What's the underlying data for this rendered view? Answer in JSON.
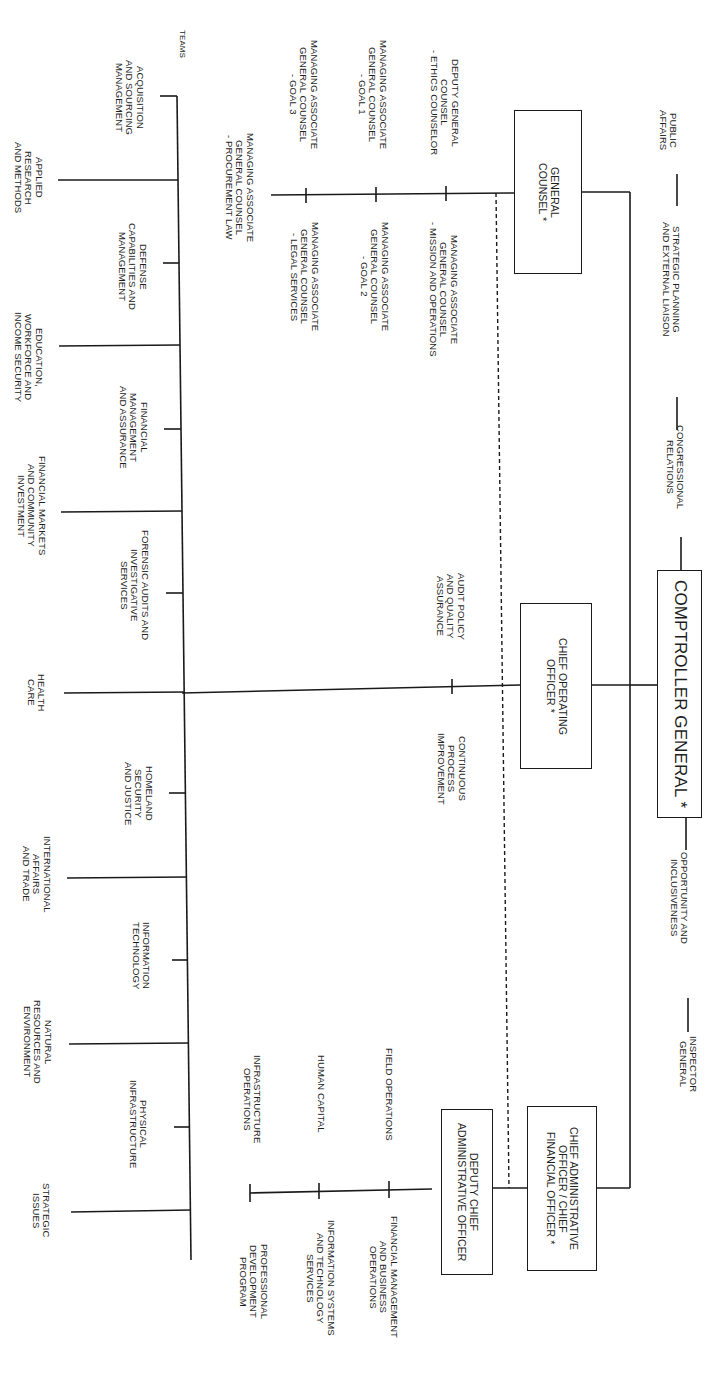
{
  "orientation": "rotated 90 degrees clockwise",
  "top_office": {
    "label": "COMPTROLLER GENERAL *"
  },
  "staff_offices": {
    "upper": [
      {
        "label": "PUBLIC\nAFFAIRS"
      },
      {
        "label": "STRATEGIC PLANNING\nAND EXTERNAL LIAISON"
      },
      {
        "label": "CONGRESSIONAL\nRELATIONS"
      }
    ],
    "lower": [
      {
        "label": "OPPORTUNITY AND\nINCLUSIVENESS"
      },
      {
        "label": "INSPECTOR\nGENERAL"
      }
    ]
  },
  "executives": {
    "general_counsel": {
      "label": "GENERAL\nCOUNSEL *",
      "units_above": [
        {
          "label": "DEPUTY GENERAL\nCOUNSEL\n- ETHICS COUNSELOR"
        },
        {
          "label": "MANAGING ASSOCIATE\nGENERAL COUNSEL\n- GOAL 1"
        },
        {
          "label": "MANAGING ASSOCIATE\nGENERAL COUNSEL\n- GOAL 3"
        }
      ],
      "units_below": [
        {
          "label": "MANAGING ASSOCIATE\nGENERAL COUNSEL\n- MISSION AND OPERATIONS"
        },
        {
          "label": "MANAGING ASSOCIATE\nGENERAL COUNSEL\n- GOAL 2"
        },
        {
          "label": "MANAGING ASSOCIATE\nGENERAL COUNSEL\n- LEGAL SERVICES"
        }
      ],
      "end_unit": {
        "label": "MANAGING ASSOCIATE\nGENERAL COUNSEL\n- PROCUREMENT LAW"
      }
    },
    "chief_operating_officer": {
      "label": "CHIEF OPERATING\nOFFICER *",
      "units": [
        {
          "label": "AUDIT POLICY\nAND QUALITY\nASSURANCE"
        },
        {
          "label": "CONTINUOUS\nPROCESS\nIMPROVEMENT"
        }
      ]
    },
    "chief_administrative_officer": {
      "label": "CHIEF ADMINISTRATIVE\nOFFICER / CHIEF\nFINANCIAL OFFICER *"
    },
    "deputy_chief_administrative_officer": {
      "label": "DEPUTY CHIEF\nADMINISTRATIVE OFFICER",
      "units_above": [
        {
          "label": "FIELD OPERATIONS"
        },
        {
          "label": "HUMAN CAPITAL"
        },
        {
          "label": "INFRASTRUCTURE\nOPERATIONS"
        }
      ],
      "units_below": [
        {
          "label": "FINANCIAL MANAGEMENT\nAND BUSINESS\nOPERATIONS"
        },
        {
          "label": "INFORMATION SYSTEMS\nAND TECHNOLOGY\nSERVICES"
        },
        {
          "label": "PROFESSIONAL\nDEVELOPMENT\nPROGRAM"
        }
      ]
    }
  },
  "teams": {
    "heading": "TEAMS",
    "items": [
      {
        "label": "ACQUISITION\nAND SOURCING\nMANAGEMENT"
      },
      {
        "label": "APPLIED\nRESEARCH\nAND METHODS"
      },
      {
        "label": "DEFENSE\nCAPABILITIES AND\nMANAGEMENT"
      },
      {
        "label": "EDUCATION,\nWORKFORCE AND\nINCOME SECURITY"
      },
      {
        "label": "FINANCIAL\nMANAGEMENT\nAND ASSURANCE"
      },
      {
        "label": "FINANCIAL MARKETS\nAND COMMUNITY\nINVESTMENT"
      },
      {
        "label": "FORENSIC AUDITS AND\nINVESTIGATIVE\nSERVICES"
      },
      {
        "label": "HEALTH\nCARE"
      },
      {
        "label": "HOMELAND\nSECURITY\nAND JUSTICE"
      },
      {
        "label": "INTERNATIONAL\nAFFAIRS\nAND TRADE"
      },
      {
        "label": "INFORMATION\nTECHNOLOGY"
      },
      {
        "label": "NATURAL\nRESOURCES AND\nENVIRONMENT"
      },
      {
        "label": "PHYSICAL\nINFRASTRUCTURE"
      },
      {
        "label": "STRATEGIC\nISSUES"
      }
    ]
  },
  "colors": {
    "line": "#1a1a1a",
    "background": "#ffffff",
    "text": "#1d1d1d"
  }
}
